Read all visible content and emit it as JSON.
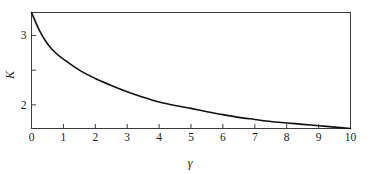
{
  "figure": {
    "background_color": "#ffffff",
    "frame_color": "#3b3b3b",
    "curve_color": "#111111"
  },
  "chart_data": {
    "type": "line",
    "title": "",
    "subtitle": "",
    "xlabel": "γ",
    "ylabel": "K",
    "xlim": [
      0,
      10
    ],
    "ylim": [
      1.66,
      3.33
    ],
    "grid": false,
    "legend": null,
    "x_ticks": [
      0,
      1,
      2,
      3,
      4,
      5,
      6,
      7,
      8,
      9,
      10
    ],
    "x_tick_labels": [
      "0",
      "1",
      "2",
      "3",
      "4",
      "5",
      "6",
      "7",
      "8",
      "9",
      "10"
    ],
    "y_ticks": [
      2.0,
      2.5,
      3.0
    ],
    "y_tick_labels": [
      "2",
      "",
      "3"
    ],
    "series": [
      {
        "name": "K(γ)",
        "x": [
          0,
          0.25,
          0.5,
          0.75,
          1,
          1.5,
          2,
          2.5,
          3,
          3.5,
          4,
          4.5,
          5,
          5.5,
          6,
          6.5,
          7,
          7.5,
          8,
          8.5,
          9,
          9.5,
          10
        ],
        "values": [
          3.33,
          3.07,
          2.88,
          2.75,
          2.66,
          2.5,
          2.38,
          2.28,
          2.19,
          2.11,
          2.04,
          1.99,
          1.95,
          1.9,
          1.86,
          1.82,
          1.79,
          1.76,
          1.74,
          1.72,
          1.7,
          1.68,
          1.66
        ]
      }
    ],
    "annotations": []
  },
  "axes": {
    "x_title": "γ",
    "y_title": "K"
  }
}
